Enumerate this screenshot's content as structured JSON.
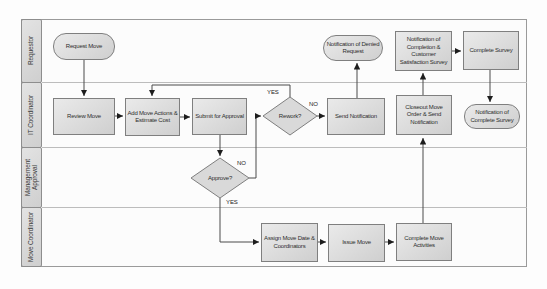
{
  "lanes": [
    {
      "label": "Requestor"
    },
    {
      "label": "IT Coordinator"
    },
    {
      "label": "Management Approval"
    },
    {
      "label": "Move Coordinator"
    }
  ],
  "nodes": {
    "request_move": {
      "label": "Request Move",
      "shape": "terminator",
      "lane": "Requestor"
    },
    "notif_denied": {
      "label": "Notification of Denied Request",
      "shape": "terminator",
      "lane": "Requestor"
    },
    "notif_completion": {
      "label": "Notification of Completion & Customer Satisfaction Survey",
      "shape": "process",
      "lane": "Requestor"
    },
    "complete_survey": {
      "label": "Complete Survey",
      "shape": "process",
      "lane": "Requestor"
    },
    "review_move": {
      "label": "Review Move",
      "shape": "process",
      "lane": "IT Coordinator"
    },
    "add_move_actions": {
      "label": "Add Move Actions & Estimate Cost",
      "shape": "process",
      "lane": "IT Coordinator"
    },
    "submit_approval": {
      "label": "Submit for Approval",
      "shape": "process",
      "lane": "IT Coordinator"
    },
    "rework": {
      "label": "Rework?",
      "shape": "decision",
      "lane": "IT Coordinator"
    },
    "send_notification": {
      "label": "Send Notification",
      "shape": "process",
      "lane": "IT Coordinator"
    },
    "closeout": {
      "label": "Closeout Move Order & Send Notification",
      "shape": "process",
      "lane": "IT Coordinator"
    },
    "notif_complete_survey": {
      "label": "Notification of Complete Survey",
      "shape": "terminator",
      "lane": "IT Coordinator"
    },
    "approve": {
      "label": "Approve?",
      "shape": "decision",
      "lane": "Management Approval"
    },
    "assign_move": {
      "label": "Assign Move Date & Coordinators",
      "shape": "process",
      "lane": "Move Coordinator"
    },
    "issue_move": {
      "label": "Issue Move",
      "shape": "process",
      "lane": "Move Coordinator"
    },
    "complete_move": {
      "label": "Complete Move Activities",
      "shape": "process",
      "lane": "Move Coordinator"
    }
  },
  "edges": {
    "rework_yes": {
      "label": "YES",
      "from": "rework",
      "to": "add_move_actions"
    },
    "rework_no": {
      "label": "NO",
      "from": "rework",
      "to": "send_notification"
    },
    "approve_no": {
      "label": "NO",
      "from": "approve",
      "to": "rework"
    },
    "approve_yes": {
      "label": "YES",
      "from": "approve",
      "to": "assign_move"
    }
  },
  "colors": {
    "node_fill": "#dcdcdc",
    "node_border": "#7f7f7f",
    "lane_fill": "#d8d8d8",
    "connector": "#4a4a4a",
    "lane_divider": "#bcbcbc",
    "frame_border": "#9a9a9a",
    "text": "#2e2e2e"
  }
}
